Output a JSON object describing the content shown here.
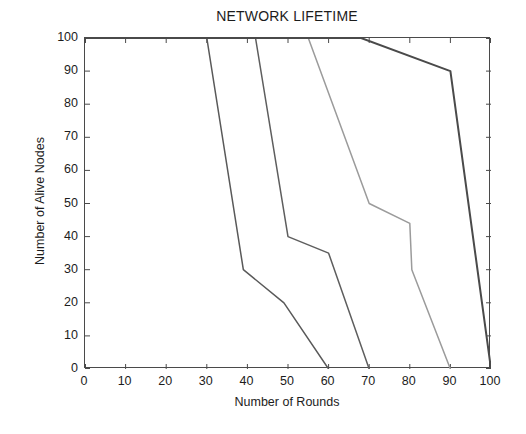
{
  "chart_data": {
    "type": "line",
    "title": "NETWORK LIFETIME",
    "xlabel": "Number of Rounds",
    "ylabel": "Number of Alive Nodes",
    "xlim": [
      0,
      100
    ],
    "ylim": [
      0,
      100
    ],
    "xticks": [
      0,
      10,
      20,
      30,
      40,
      50,
      60,
      70,
      80,
      90,
      100
    ],
    "yticks": [
      0,
      10,
      20,
      30,
      40,
      50,
      60,
      70,
      80,
      90,
      100
    ],
    "grid": false,
    "legend": "none",
    "series": [
      {
        "name": "curve-1",
        "color": "#595959",
        "width": 1.5,
        "points": [
          {
            "x": 0,
            "y": 100
          },
          {
            "x": 30,
            "y": 100
          },
          {
            "x": 39,
            "y": 30
          },
          {
            "x": 49,
            "y": 20
          },
          {
            "x": 60,
            "y": 0
          }
        ]
      },
      {
        "name": "curve-2",
        "color": "#5e5e5e",
        "width": 1.5,
        "points": [
          {
            "x": 0,
            "y": 100
          },
          {
            "x": 42,
            "y": 100
          },
          {
            "x": 50,
            "y": 40
          },
          {
            "x": 60,
            "y": 35
          },
          {
            "x": 70,
            "y": 0
          }
        ]
      },
      {
        "name": "curve-3",
        "color": "#9b9b9b",
        "width": 1.5,
        "points": [
          {
            "x": 0,
            "y": 100
          },
          {
            "x": 55,
            "y": 100
          },
          {
            "x": 70,
            "y": 50
          },
          {
            "x": 80,
            "y": 44
          },
          {
            "x": 80.5,
            "y": 30
          },
          {
            "x": 90,
            "y": 0
          }
        ]
      },
      {
        "name": "curve-4",
        "color": "#4a4a4a",
        "width": 2.0,
        "points": [
          {
            "x": 0,
            "y": 100
          },
          {
            "x": 68,
            "y": 100
          },
          {
            "x": 90,
            "y": 90
          },
          {
            "x": 100,
            "y": 0
          }
        ]
      }
    ]
  },
  "axes": {
    "x_tick_labels": [
      "0",
      "10",
      "20",
      "30",
      "40",
      "50",
      "60",
      "70",
      "80",
      "90",
      "100"
    ],
    "y_tick_labels": [
      "0",
      "10",
      "20",
      "30",
      "40",
      "50",
      "60",
      "70",
      "80",
      "90",
      "100"
    ]
  }
}
